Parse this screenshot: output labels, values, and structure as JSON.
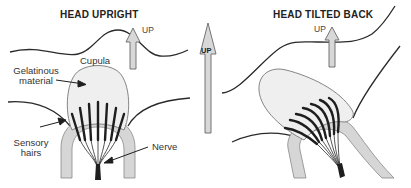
{
  "panels": {
    "left": {
      "title": "HEAD UPRIGHT",
      "up_label": "UP",
      "labels": {
        "cupula": "Cupula",
        "gelatinous_line1": "Gelatinous",
        "gelatinous_line2": "material",
        "sensory_line1": "Sensory",
        "sensory_line2": "hairs",
        "nerve": "Nerve"
      }
    },
    "center": {
      "up_label": "UP"
    },
    "right": {
      "title": "HEAD TILTED BACK",
      "up_label": "UP"
    }
  },
  "colors": {
    "line": "#2a2a2a",
    "cupula_fill": "#efefef",
    "canal_fill": "#d6d6d6",
    "arrow_fill": "#d8d8d8",
    "arrow_stroke": "#666666",
    "hair": "#1e1e1e"
  }
}
